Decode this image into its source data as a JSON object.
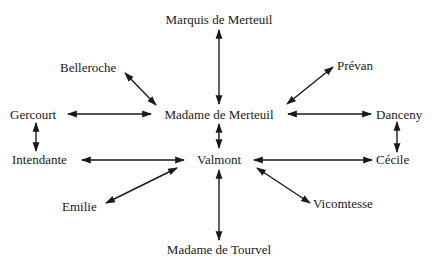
{
  "diagram": {
    "type": "relationship-network",
    "colors": {
      "text": "#1a1a1a",
      "arrow": "#1a1a1a",
      "background": "#ffffff"
    },
    "nodes": {
      "marquis": "Marquis de Merteuil",
      "merteuil": "Madame de Merteuil",
      "valmont": "Valmont",
      "tourvel": "Madame de Tourvel",
      "belleroche": "Belleroche",
      "prevan": "Prévan",
      "gercourt": "Gercourt",
      "danceny": "Danceny",
      "intendante": "Intendante",
      "cecile": "Cécile",
      "emilie": "Emilie",
      "vicomtesse": "Vicomtesse"
    },
    "edges": [
      {
        "from": "Marquis de Merteuil",
        "to": "Madame de Merteuil",
        "bidirectional": true
      },
      {
        "from": "Belleroche",
        "to": "Madame de Merteuil",
        "bidirectional": true
      },
      {
        "from": "Prévan",
        "to": "Madame de Merteuil",
        "bidirectional": true
      },
      {
        "from": "Gercourt",
        "to": "Madame de Merteuil",
        "bidirectional": true
      },
      {
        "from": "Danceny",
        "to": "Madame de Merteuil",
        "bidirectional": true
      },
      {
        "from": "Madame de Merteuil",
        "to": "Valmont",
        "bidirectional": true
      },
      {
        "from": "Gercourt",
        "to": "Intendante",
        "bidirectional": true
      },
      {
        "from": "Danceny",
        "to": "Cécile",
        "bidirectional": true
      },
      {
        "from": "Intendante",
        "to": "Valmont",
        "bidirectional": true
      },
      {
        "from": "Cécile",
        "to": "Valmont",
        "bidirectional": true
      },
      {
        "from": "Emilie",
        "to": "Valmont",
        "bidirectional": true
      },
      {
        "from": "Vicomtesse",
        "to": "Valmont",
        "bidirectional": true
      },
      {
        "from": "Valmont",
        "to": "Madame de Tourvel",
        "bidirectional": true
      }
    ]
  }
}
